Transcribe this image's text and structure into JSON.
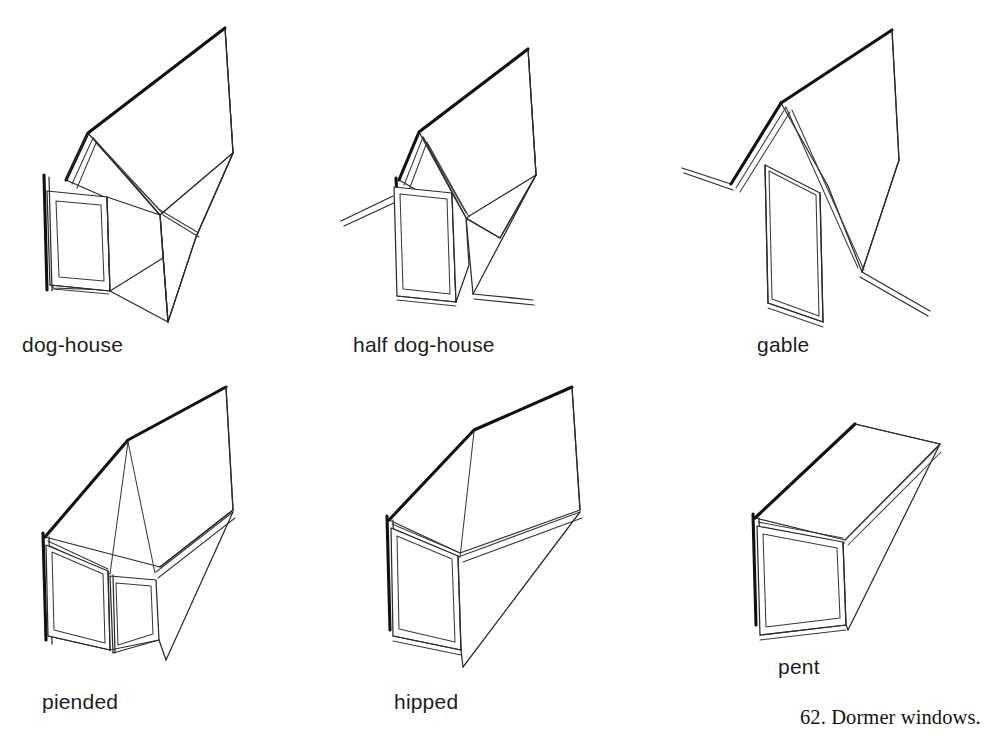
{
  "plate": {
    "number": "62.",
    "title": "Dormer windows.",
    "caption": "62.  Dormer windows."
  },
  "page": {
    "width": 1001,
    "height": 752,
    "background": "#ffffff",
    "ink": "#2b2b2b",
    "heavy_ink": "#111111"
  },
  "figures": [
    {
      "id": "dog-house",
      "label": "dog-house",
      "row": 1,
      "column": 1
    },
    {
      "id": "half-dog-house",
      "label": "half dog-house",
      "row": 1,
      "column": 2
    },
    {
      "id": "gable",
      "label": "gable",
      "row": 1,
      "column": 3
    },
    {
      "id": "piended",
      "label": "piended",
      "row": 2,
      "column": 1
    },
    {
      "id": "hipped",
      "label": "hipped",
      "row": 2,
      "column": 2
    },
    {
      "id": "pent",
      "label": "pent",
      "row": 2,
      "column": 3
    }
  ],
  "labels": {
    "dog_house": "dog-house",
    "half_dog_house": "half dog-house",
    "gable": "gable",
    "piended": "piended",
    "hipped": "hipped",
    "pent": "pent"
  }
}
